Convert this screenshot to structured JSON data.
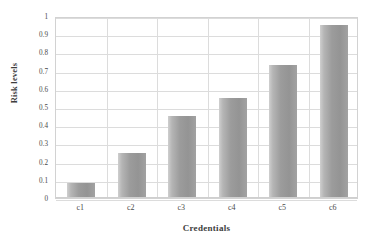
{
  "chart_data": {
    "type": "bar",
    "title": "",
    "xlabel": "Credentials",
    "ylabel": "Risk levels",
    "categories": [
      "c1",
      "c2",
      "c3",
      "c4",
      "c5",
      "c6"
    ],
    "values": [
      0.08,
      0.245,
      0.45,
      0.55,
      0.73,
      0.95
    ],
    "ylim": [
      0,
      1
    ],
    "ytick_labels": [
      "1",
      "0.9",
      "0.8",
      "0.7",
      "0.6",
      "0.5",
      "0.4",
      "0.3",
      "0.2",
      "0.1",
      "0"
    ],
    "ytick_values": [
      1,
      0.9,
      0.8,
      0.7,
      0.6,
      0.5,
      0.4,
      0.3,
      0.2,
      0.1,
      0
    ],
    "grid": true,
    "grid_horizontal": true,
    "grid_vertical": true,
    "legend": false,
    "legend_position": "none",
    "series": [
      {
        "name": "Risk levels",
        "values": [
          0.08,
          0.245,
          0.45,
          0.55,
          0.73,
          0.95
        ]
      }
    ],
    "colors": {
      "bar_light": "#cfcfcf",
      "bar_mid": "#9c9c9c",
      "bar_dark": "#949494",
      "gridline": "#dcdcdc",
      "axis_border": "#d2d2d2",
      "text": "#3d3d3d",
      "background": "#ffffff"
    }
  }
}
